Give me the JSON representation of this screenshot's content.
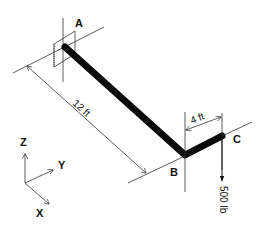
{
  "diagram": {
    "points": {
      "A": {
        "label": "A"
      },
      "B": {
        "label": "B"
      },
      "C": {
        "label": "C"
      }
    },
    "dimensions": {
      "AB": {
        "label": "12 ft"
      },
      "BC": {
        "label": "4 ft"
      }
    },
    "load": {
      "label": "500 lb",
      "direction": "down",
      "point": "C"
    },
    "axes": {
      "z": "Z",
      "y": "Y",
      "x": "X"
    },
    "colors": {
      "ink": "#111111",
      "background": "#ffffff"
    }
  }
}
